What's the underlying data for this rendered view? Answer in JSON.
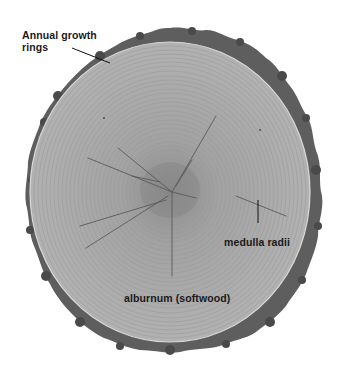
{
  "diagram": {
    "colors": {
      "background": "#ffffff",
      "bark": "#5e5e5e",
      "bark_dark": "#474747",
      "wood": "#ababab",
      "wood_center": "#8f8f8f",
      "ring_line": "#9a9a9a",
      "label_text": "#1a1a1a",
      "leader_line": "#111111"
    },
    "labels": {
      "growth_rings_line1": "Annual growth",
      "growth_rings_line2": "rings",
      "medulla_radii": "medulla radii",
      "alburnum": "alburnum (softwood)"
    },
    "parts": [
      {
        "name": "bark",
        "description": "outer irregular dark layer"
      },
      {
        "name": "annual growth rings",
        "description": "concentric rings"
      },
      {
        "name": "medulla radii",
        "description": "radial cracks/rays from center"
      },
      {
        "name": "alburnum (softwood)",
        "description": "outer light wood"
      }
    ]
  }
}
